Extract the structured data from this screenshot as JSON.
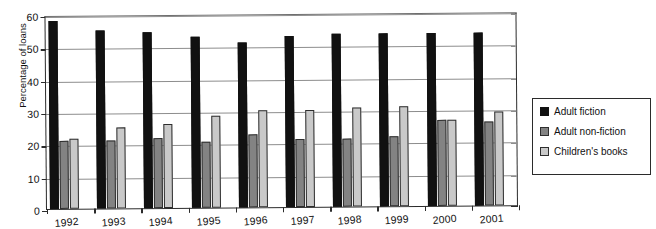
{
  "chart_data": {
    "type": "bar",
    "title": "",
    "xlabel": "",
    "ylabel": "Percentage of loans",
    "ylim": [
      0,
      60
    ],
    "yticks": [
      0,
      10,
      20,
      30,
      40,
      50,
      60
    ],
    "grid": true,
    "legend_position": "right",
    "categories": [
      "1992",
      "1993",
      "1994",
      "1995",
      "1996",
      "1997",
      "1998",
      "1999",
      "2000",
      "2001"
    ],
    "series": [
      {
        "name": "Adult fiction",
        "color": "#111111",
        "values": [
          58,
          55,
          54.5,
          53,
          51,
          53,
          53.5,
          53.5,
          53.5,
          53.5
        ]
      },
      {
        "name": "Adult non-fiction",
        "color": "#838383",
        "values": [
          21,
          21,
          21.5,
          20.5,
          22.5,
          21,
          21,
          21.5,
          26.5,
          26
        ]
      },
      {
        "name": "Children's books",
        "color": "#c9c9c9",
        "values": [
          21.5,
          25,
          26,
          28.5,
          30,
          30,
          30.5,
          31,
          26.5,
          29
        ]
      }
    ]
  },
  "legend": {
    "items": [
      {
        "label": "Adult fiction"
      },
      {
        "label": "Adult non-fiction"
      },
      {
        "label": "Children's books"
      }
    ]
  }
}
